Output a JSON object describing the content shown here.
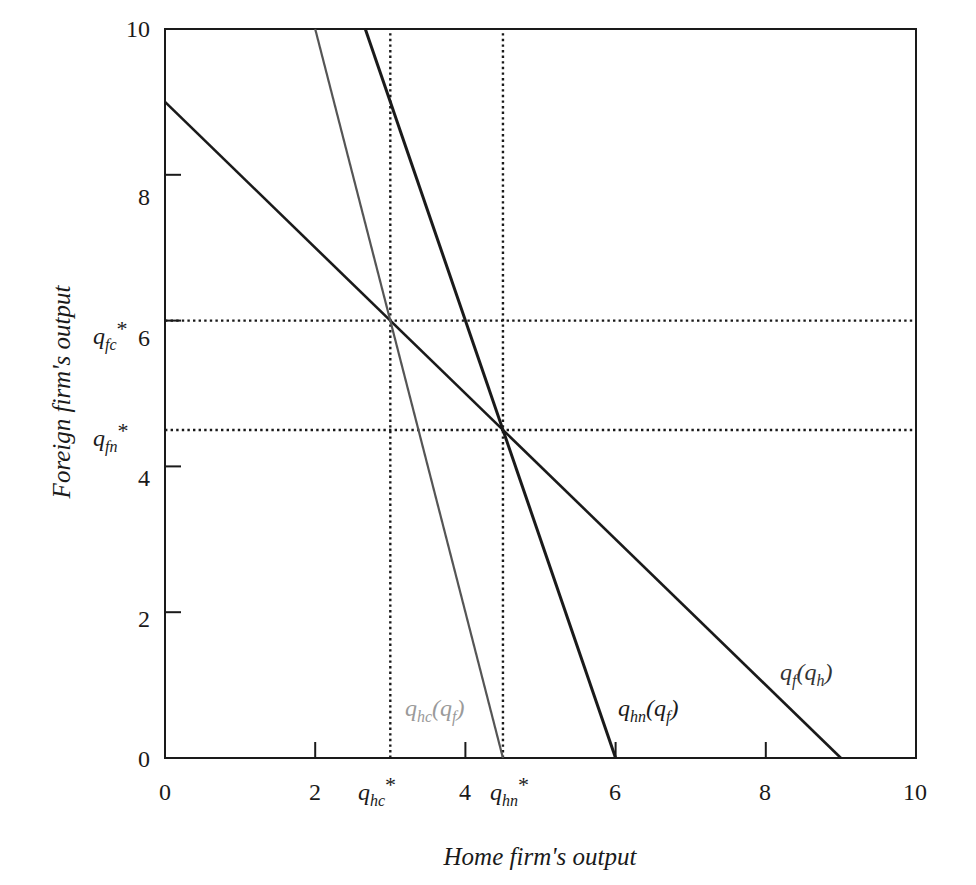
{
  "chart_data": {
    "type": "line",
    "title": "",
    "xlabel": "Home firm's output",
    "ylabel": "Foreign firm's output",
    "xlim": [
      0,
      10
    ],
    "ylim": [
      0,
      10
    ],
    "xticks": [
      0,
      2,
      4,
      6,
      8,
      10
    ],
    "yticks": [
      0,
      2,
      4,
      6,
      8,
      10
    ],
    "grid": false,
    "series": [
      {
        "name": "q_f(q_h)",
        "label_main": "q",
        "label_sub": "f",
        "label_arg": "q",
        "label_arg_sub": "h",
        "color": "#1a1a1a",
        "width": 2.6,
        "points": [
          [
            0,
            9
          ],
          [
            9,
            0
          ]
        ]
      },
      {
        "name": "q_hn(q_f)",
        "label_main": "q",
        "label_sub": "hn",
        "label_arg": "q",
        "label_arg_sub": "f",
        "color": "#1a1a1a",
        "width": 3.0,
        "points": [
          [
            2.667,
            10
          ],
          [
            6,
            0
          ]
        ]
      },
      {
        "name": "q_hc(q_f)",
        "label_main": "q",
        "label_sub": "hc",
        "label_arg": "q",
        "label_arg_sub": "f",
        "color": "#555555",
        "label_color": "#9a9a9a",
        "width": 2.2,
        "points": [
          [
            2,
            10
          ],
          [
            4.5,
            0
          ]
        ]
      }
    ],
    "reference_lines": [
      {
        "orientation": "vertical",
        "value": 3,
        "label": "q_hc*",
        "style": "dotted"
      },
      {
        "orientation": "vertical",
        "value": 4.5,
        "label": "q_hn*",
        "style": "dotted"
      },
      {
        "orientation": "horizontal",
        "value": 6,
        "label": "q_fc*",
        "style": "dotted"
      },
      {
        "orientation": "horizontal",
        "value": 4.5,
        "label": "q_fn*",
        "style": "dotted"
      }
    ],
    "equilibria": [
      {
        "name": "collusive/Cournot-c",
        "x": 3,
        "y": 6
      },
      {
        "name": "Nash",
        "x": 4.5,
        "y": 4.5
      }
    ]
  },
  "labels": {
    "x_axis_title": "Home firm's output",
    "y_axis_title": "Foreign firm's output",
    "x_ticks": [
      "0",
      "2",
      "4",
      "6",
      "8",
      "10"
    ],
    "y_ticks": [
      "0",
      "2",
      "4",
      "6",
      "8",
      "10"
    ],
    "q": "q",
    "star": "*",
    "paren_open": "(",
    "paren_close": ")",
    "sub_hc": "hc",
    "sub_hn": "hn",
    "sub_fc": "fc",
    "sub_fn": "fn",
    "sub_f": "f",
    "sub_h": "h"
  }
}
